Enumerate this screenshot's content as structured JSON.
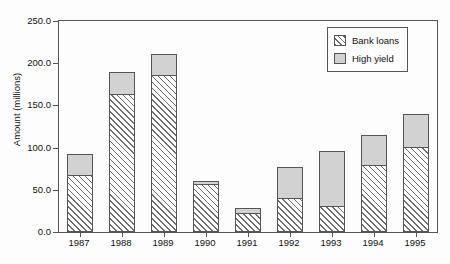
{
  "chart_data": {
    "type": "bar",
    "stacked": true,
    "title": "",
    "xlabel": "",
    "ylabel": "Amount (millions)",
    "categories": [
      "1987",
      "1988",
      "1989",
      "1990",
      "1991",
      "1992",
      "1993",
      "1994",
      "1995"
    ],
    "series": [
      {
        "name": "Bank loans",
        "pattern": "diagonal-hatch",
        "color": "#ffffff",
        "values": [
          67,
          163,
          186,
          57,
          23,
          40,
          31,
          79,
          101
        ]
      },
      {
        "name": "High yield",
        "pattern": "solid",
        "color": "#d2d2d2",
        "values": [
          26,
          27,
          25,
          3,
          5,
          37,
          65,
          36,
          39
        ]
      }
    ],
    "totals": [
      93,
      190,
      211,
      60,
      28,
      77,
      96,
      115,
      140
    ],
    "ylim": [
      0,
      250
    ],
    "yticks": [
      0.0,
      50.0,
      100.0,
      150.0,
      200.0,
      250.0
    ],
    "ytick_labels": [
      "0.0",
      "50.0",
      "100.0",
      "150.0",
      "200.0",
      "250.0"
    ],
    "grid": false,
    "legend_position": "top-right"
  },
  "legend": {
    "items": [
      {
        "label": "Bank loans",
        "swatch": "hatch"
      },
      {
        "label": "High yield",
        "swatch": "solid"
      }
    ]
  },
  "colors": {
    "axis": "#555555",
    "high_yield": "#d2d2d2",
    "hatch_line": "#6e6e6e",
    "background": "#fdfdfd"
  }
}
